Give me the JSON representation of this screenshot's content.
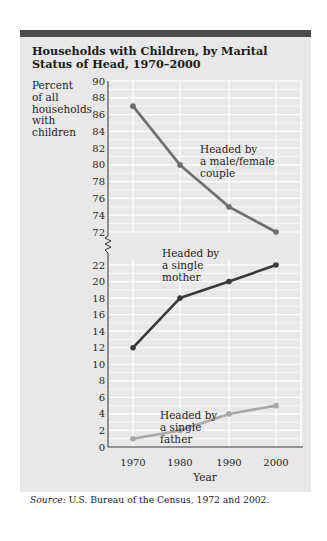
{
  "title": "Households with Children, by Marital Status of Head, 1970–2000",
  "ylabel_lines": [
    "Percent",
    "of all",
    "households",
    "with",
    "children"
  ],
  "xlabel": "Year",
  "source_label": "Source:",
  "source_text": " U.S. Bureau of the Census, 1972 and 2002.",
  "colors": {
    "background": "#e8e8e8",
    "topbar": "#4a4a4a",
    "couple": "#6e6e6e",
    "mother": "#3a3a3a",
    "father": "#a8a8a8",
    "grid": "#ffffff"
  },
  "chart_data": {
    "type": "line",
    "title": "Households with Children, by Marital Status of Head, 1970–2000",
    "xlabel": "Year",
    "ylabel": "Percent of all households with children",
    "categories": [
      "1970",
      "1980",
      "1990",
      "2000"
    ],
    "series": [
      {
        "name": "Headed by a male/female couple",
        "values": [
          87,
          80,
          75,
          72
        ]
      },
      {
        "name": "Headed by a single mother",
        "values": [
          12,
          18,
          20,
          22
        ]
      },
      {
        "name": "Headed by a single father",
        "values": [
          1,
          2,
          4,
          5
        ]
      }
    ],
    "y_axis_break": {
      "lower_segment": [
        0,
        22
      ],
      "upper_segment": [
        72,
        90
      ]
    },
    "upper_ticks": [
      72,
      74,
      76,
      78,
      80,
      82,
      84,
      86,
      88,
      90
    ],
    "lower_ticks": [
      0,
      2,
      4,
      6,
      8,
      10,
      12,
      14,
      16,
      18,
      20,
      22
    ],
    "annotations": [
      {
        "lines": [
          "Headed by",
          "a male/female",
          "couple"
        ]
      },
      {
        "lines": [
          "Headed by",
          "a single",
          "mother"
        ]
      },
      {
        "lines": [
          "Headed by",
          "a single",
          "father"
        ]
      }
    ],
    "grid": true,
    "legend": "inline annotations",
    "source": "Source: U.S. Bureau of the Census, 1972 and 2002."
  }
}
